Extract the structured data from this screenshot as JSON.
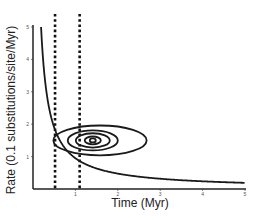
{
  "chart_data": {
    "type": "line",
    "title": "",
    "xlabel": "Time (Myr)",
    "ylabel": "Rate (0.1 substitutions/site/Myr)",
    "xlim": [
      0,
      5
    ],
    "ylim": [
      0,
      5
    ],
    "x_ticks": [
      "1",
      "2",
      "3",
      "4",
      "5"
    ],
    "y_ticks": [
      "1",
      "2",
      "3",
      "4",
      "5"
    ],
    "grid": false,
    "legend": null,
    "series": [
      {
        "name": "rate-curve",
        "style": "solid",
        "description": "hyperbolic decay, rate ≈ 0.95 / time",
        "x": [
          0.19,
          0.25,
          0.3,
          0.4,
          0.5,
          0.6,
          0.8,
          1.0,
          1.2,
          1.5,
          2.0,
          2.5,
          3.0,
          3.5,
          4.0,
          4.5,
          5.0
        ],
        "y": [
          5.0,
          3.8,
          3.17,
          2.38,
          1.9,
          1.58,
          1.19,
          0.95,
          0.79,
          0.63,
          0.48,
          0.38,
          0.32,
          0.27,
          0.24,
          0.21,
          0.19
        ]
      }
    ],
    "reference_lines": [
      {
        "orientation": "vertical",
        "x": 0.52,
        "style": "dotted"
      },
      {
        "orientation": "vertical",
        "x": 1.1,
        "style": "dotted"
      }
    ],
    "contours": [
      {
        "center_x": 1.58,
        "center_y": 1.5,
        "radius_x": 1.1,
        "radius_y": 0.46
      },
      {
        "center_x": 1.41,
        "center_y": 1.5,
        "radius_x": 0.59,
        "radius_y": 0.31
      },
      {
        "center_x": 1.41,
        "center_y": 1.5,
        "radius_x": 0.4,
        "radius_y": 0.22
      },
      {
        "center_x": 1.41,
        "center_y": 1.5,
        "radius_x": 0.19,
        "radius_y": 0.12
      },
      {
        "center_x": 1.41,
        "center_y": 1.5,
        "radius_x": 0.07,
        "radius_y": 0.06
      }
    ]
  }
}
